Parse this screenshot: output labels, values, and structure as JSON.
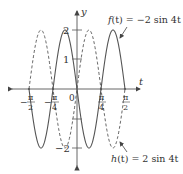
{
  "chart_data": {
    "type": "line",
    "title": "",
    "xlabel": "t",
    "ylabel": "y",
    "xlim": [
      -1.75,
      1.75
    ],
    "ylim": [
      -2.2,
      2.2
    ],
    "grid": false,
    "x_ticks": [
      {
        "value": -1.5708,
        "label_num": "π",
        "label_den": "2",
        "sign": "−"
      },
      {
        "value": -0.7854,
        "label_num": "π",
        "label_den": "4",
        "sign": "−"
      },
      {
        "value": 0.7854,
        "label_num": "π",
        "label_den": "4",
        "sign": ""
      },
      {
        "value": 1.5708,
        "label_num": "π",
        "label_den": "2",
        "sign": ""
      }
    ],
    "y_ticks": [
      {
        "value": 2,
        "label": "2"
      },
      {
        "value": 1,
        "label": "1"
      },
      {
        "value": -1,
        "label": ""
      },
      {
        "value": -2,
        "label": "−2"
      }
    ],
    "origin_label": "0",
    "series": [
      {
        "name": "f(t) = −2 sin 4t",
        "expression": "-2*sin(4t)",
        "style": "solid",
        "color": "#555555",
        "t_range": [
          -1.5708,
          1.5708
        ]
      },
      {
        "name": "h(t) = 2 sin 4t",
        "expression": "2*sin(4t)",
        "style": "dashed",
        "color": "#555555",
        "t_range": [
          -1.5708,
          1.5708
        ]
      }
    ],
    "annotations": [
      {
        "text": "f(t) = −2 sin 4t",
        "points_to": "solid curve near t≈π/2"
      },
      {
        "text": "h(t) = 2 sin 4t",
        "points_to": "dashed curve near t≈π/2"
      }
    ]
  },
  "labels": {
    "y_axis": "y",
    "t_axis": "t",
    "origin": "0",
    "y2": "2",
    "y1": "1",
    "yneg2": "−2",
    "f_label_name": "f",
    "f_label_rest": "(t) = −2 sin 4t",
    "h_label_name": "h",
    "h_label_rest": "(t) = 2 sin 4t",
    "pi": "π",
    "two": "2",
    "four": "4",
    "minus": "−"
  }
}
